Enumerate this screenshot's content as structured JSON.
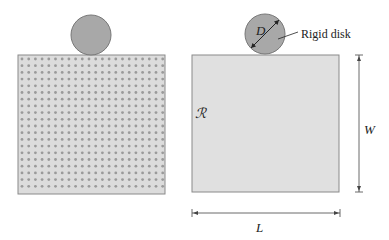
{
  "figure": {
    "left_panel": {
      "description": "perforated domain with rigid disk on top",
      "rect": {
        "x": 18,
        "y": 55,
        "w": 147,
        "h": 139,
        "fill": "#dcdcdc",
        "stroke": "#8a8a8a"
      },
      "dots": {
        "start_x": 22,
        "start_y": 59,
        "spacing": 6.7,
        "r": 1.4,
        "color": "#9a9a9a"
      },
      "disk": {
        "cx": 91,
        "cy": 35,
        "r": 20,
        "fill": "#a8a8a8",
        "stroke": "#777777"
      }
    },
    "right_panel": {
      "rect": {
        "x": 192,
        "y": 55,
        "w": 147,
        "h": 137,
        "fill": "#e0e0e0",
        "stroke": "#8a8a8a"
      },
      "disk": {
        "cx": 265,
        "cy": 34,
        "r": 20,
        "fill": "#a8a8a8",
        "stroke": "#777777"
      },
      "labels": {
        "diameter": "D",
        "disk_label": "Rigid disk",
        "region": "ℛ",
        "width": "W",
        "length": "L"
      }
    }
  }
}
